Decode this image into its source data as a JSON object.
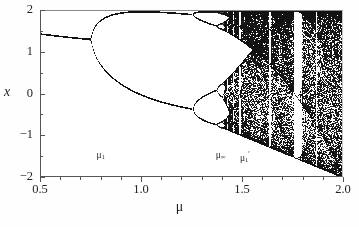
{
  "figure": {
    "kind": "bifurcation-diagram",
    "background_color": "#ffffff",
    "ink_color": "#111111",
    "axis_color": "#555555"
  },
  "axes": {
    "x_title": "μ",
    "y_title": "x",
    "x_tick_labels": [
      "0.5",
      "1.0",
      "1.5",
      "2.0"
    ],
    "y_tick_labels": [
      "2",
      "1",
      "0",
      "−1",
      "−2"
    ]
  },
  "annotations": [
    {
      "name": "mu-1",
      "base": "μ",
      "sub": "1",
      "sup": "",
      "mu": 0.8,
      "x_value": 0.8,
      "y_value": -1.48
    },
    {
      "name": "mu-infinity",
      "base": "μ",
      "sub": "∞",
      "sup": "",
      "mu": 1.39,
      "x_value": 1.39,
      "y_value": -1.48
    },
    {
      "name": "mu-1-prime",
      "base": "μ",
      "sub": "1",
      "sup": "′",
      "mu": 1.51,
      "x_value": 1.51,
      "y_value": -1.48
    }
  ],
  "chart_data": {
    "type": "scatter",
    "title": "",
    "subtitle": "",
    "xlabel": "μ",
    "ylabel": "x",
    "xlim": [
      0.5,
      2.0
    ],
    "ylim": [
      -2,
      2
    ],
    "grid": false,
    "legend": null,
    "x_ticks_major": [
      0.5,
      1.0,
      1.5,
      2.0
    ],
    "x_ticks_minor": [
      0.6,
      0.7,
      0.8,
      0.9,
      1.1,
      1.2,
      1.3,
      1.4,
      1.6,
      1.7,
      1.8,
      1.9
    ],
    "y_ticks_major": [
      2,
      1,
      0,
      -1,
      -2
    ],
    "y_ticks_minor": [
      1.5,
      0.5,
      -0.5,
      -1.5
    ],
    "map": {
      "description": "attractor of the map x_{n+1} = 1 - mu * x_n^2 reflected/plotted as x vs mu; period-doubling cascade into chaos",
      "equation": "x_{n+1} = 1 - mu*x_n^2",
      "iterations_discarded": 300,
      "iterations_plotted": 220,
      "mu_samples": 303
    },
    "features": {
      "fixed_point_start_value": 0.38,
      "first_bifurcation_mu": 0.75,
      "first_bifurcation_x": 0.5,
      "second_bifurcation_mu": 1.25,
      "accumulation_mu": 1.401,
      "chaos_band_upper_at_mu2": 2.0,
      "chaos_band_lower_at_mu2": -2.0
    },
    "periodic_windows": [
      {
        "mu_start": 1.455,
        "mu_end": 1.475,
        "label": "period-window"
      },
      {
        "mu_start": 1.495,
        "mu_end": 1.51,
        "label": "period-window"
      },
      {
        "mu_start": 1.625,
        "mu_end": 1.645,
        "label": "period-window"
      },
      {
        "mu_start": 1.745,
        "mu_end": 1.79,
        "label": "period-3-window"
      },
      {
        "mu_start": 1.855,
        "mu_end": 1.87,
        "label": "period-window"
      }
    ]
  }
}
